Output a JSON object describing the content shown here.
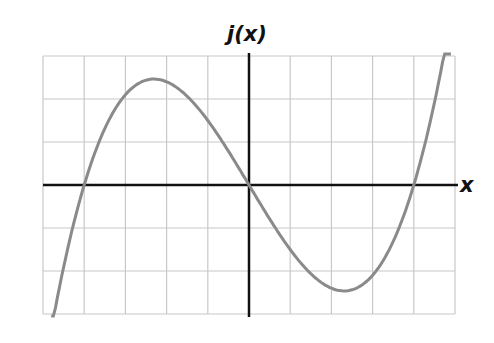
{
  "chart_data": {
    "type": "line",
    "title": "j(x)",
    "xlabel": "x",
    "ylabel": "",
    "xlim": [
      -5,
      5
    ],
    "ylim": [
      -3,
      3
    ],
    "grid": true,
    "grid_step": 1,
    "tick_labels_shown": false,
    "series": [
      {
        "name": "j(x)",
        "description": "cubic with roots at x = -4, 0, 4; local max ≈ (-2.3, 2.5), local min ≈ (2.3, -2.5)",
        "x": [
          -4.8,
          -4.5,
          -4,
          -3.5,
          -3,
          -2.5,
          -2.3,
          -2,
          -1.5,
          -1,
          -0.5,
          0,
          0.5,
          1,
          1.5,
          2,
          2.3,
          2.5,
          3,
          3.5,
          4,
          4.5,
          4.9
        ],
        "y": [
          -3.38,
          -1.91,
          0,
          1.31,
          2.1,
          2.44,
          2.46,
          2.4,
          2.06,
          1.5,
          0.79,
          0,
          -0.79,
          -1.5,
          -2.06,
          -2.4,
          -2.46,
          -2.44,
          -2.1,
          -1.31,
          0,
          1.91,
          3.92
        ]
      }
    ],
    "colors": {
      "curve": "#8a8a8a",
      "axes": "#111111",
      "grid": "#c8c8c8"
    }
  }
}
